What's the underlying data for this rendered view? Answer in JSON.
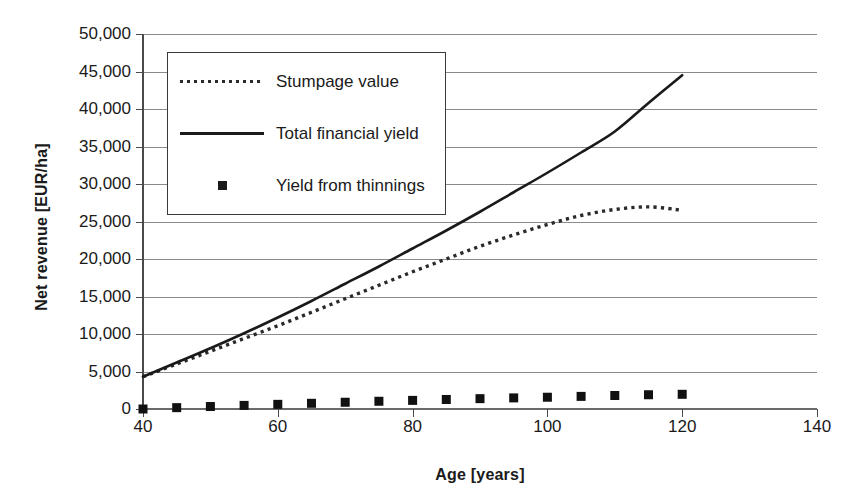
{
  "chart_data": {
    "type": "line",
    "title": "",
    "xlabel": "Age [years]",
    "ylabel": "Net revenue [EUR/ha]",
    "xlim": [
      40,
      140
    ],
    "ylim": [
      0,
      50000
    ],
    "xticks": [
      40,
      60,
      80,
      100,
      120,
      140
    ],
    "xtick_labels": [
      "40",
      "60",
      "80",
      "100",
      "120",
      "140"
    ],
    "yticks": [
      0,
      5000,
      10000,
      15000,
      20000,
      25000,
      30000,
      35000,
      40000,
      45000,
      50000
    ],
    "ytick_labels": [
      "0",
      "5,000",
      "10,000",
      "15,000",
      "20,000",
      "25,000",
      "30,000",
      "35,000",
      "40,000",
      "45,000",
      "50,000"
    ],
    "grid": "horizontal",
    "legend_position": "upper-left-inside",
    "x": [
      40,
      45,
      50,
      55,
      60,
      65,
      70,
      75,
      80,
      85,
      90,
      95,
      100,
      105,
      110,
      115,
      120
    ],
    "series": [
      {
        "name": "Stumpage value",
        "style": "dotted",
        "color": "#2a2a2a",
        "values": [
          4300,
          6000,
          7700,
          9400,
          11100,
          12900,
          14700,
          16500,
          18300,
          20000,
          21700,
          23200,
          24600,
          25800,
          26600,
          26950,
          26500
        ]
      },
      {
        "name": "Total financial yield",
        "style": "solid",
        "color": "#1a1a1a",
        "values": [
          4300,
          6200,
          8100,
          10100,
          12200,
          14400,
          16700,
          19000,
          21400,
          23800,
          26300,
          28900,
          31500,
          34200,
          37000,
          40800,
          44500
        ]
      },
      {
        "name": "Yield from thinnings",
        "style": "marker-square",
        "color": "#111111",
        "values": [
          0,
          180,
          330,
          480,
          620,
          760,
          900,
          1030,
          1150,
          1270,
          1380,
          1480,
          1570,
          1680,
          1800,
          1900,
          1960
        ]
      }
    ]
  },
  "legend": {
    "items": [
      {
        "label": "Stumpage value",
        "key": "dotted-line-key"
      },
      {
        "label": "Total financial yield",
        "key": "solid-line-key"
      },
      {
        "label": "Yield from thinnings",
        "key": "square-marker-key"
      }
    ]
  },
  "axes": {
    "x_title": "Age [years]",
    "y_title": "Net revenue [EUR/ha]"
  }
}
